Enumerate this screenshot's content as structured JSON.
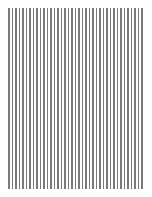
{
  "pattern": {
    "type": "vertical-lines",
    "line_count": 39,
    "line_color": "#7a7a7a",
    "background_color": "#ffffff",
    "bounds": {
      "left": 8,
      "top": 8,
      "right": 143,
      "bottom": 189
    }
  }
}
